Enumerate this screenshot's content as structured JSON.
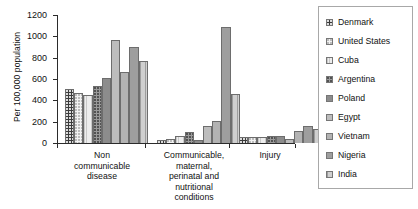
{
  "chart_data": {
    "type": "bar",
    "title": "",
    "subtitle": "",
    "xlabel": "",
    "ylabel": "Per 100,000 population",
    "ylim": [
      0,
      1200
    ],
    "yticks": [
      0,
      200,
      400,
      600,
      800,
      1000,
      1200
    ],
    "grid": false,
    "legend_position": "right",
    "categories": [
      "Non communicable disease",
      "Communicable, maternal, perinatal and nutritional conditions",
      "Injury"
    ],
    "category_labels": [
      [
        "Non",
        "communicable",
        "disease"
      ],
      [
        "Communicable,",
        "maternal,",
        "perinatal and",
        "nutritional",
        "conditions"
      ],
      [
        "Injury"
      ]
    ],
    "series": [
      {
        "name": "Denmark",
        "swatch": "dark-dotted",
        "values": [
          510,
          30,
          55
        ]
      },
      {
        "name": "United States",
        "swatch": "light-dotted",
        "values": [
          465,
          40,
          55
        ]
      },
      {
        "name": "Cuba",
        "swatch": "light-hatch",
        "values": [
          450,
          70,
          55
        ]
      },
      {
        "name": "Argentina",
        "swatch": "gray-dotted",
        "values": [
          530,
          100,
          65
        ]
      },
      {
        "name": "Poland",
        "swatch": "dark-solid",
        "values": [
          605,
          25,
          70
        ]
      },
      {
        "name": "Egypt",
        "swatch": "light-solid",
        "values": [
          970,
          160,
          35
        ]
      },
      {
        "name": "Vietnam",
        "swatch": "pale-solid",
        "values": [
          670,
          210,
          110
        ]
      },
      {
        "name": "Nigeria",
        "swatch": "medium-solid",
        "values": [
          900,
          1090,
          155
        ]
      },
      {
        "name": "India",
        "swatch": "pale-hatch",
        "values": [
          765,
          455,
          135
        ]
      }
    ]
  },
  "legend": {
    "items": [
      {
        "label": "Denmark"
      },
      {
        "label": "United States"
      },
      {
        "label": "Cuba"
      },
      {
        "label": "Argentina"
      },
      {
        "label": "Poland"
      },
      {
        "label": "Egypt"
      },
      {
        "label": "Vietnam"
      },
      {
        "label": "Nigeria"
      },
      {
        "label": "India"
      }
    ]
  },
  "axis": {
    "y_title": "Per 100,000 population",
    "y_ticks": [
      "0",
      "200",
      "400",
      "600",
      "800",
      "1000",
      "1200"
    ]
  },
  "colors": {
    "axis": "#2b2b2b",
    "text": "#111111",
    "legend_border": "#a8a8a8",
    "bar_outline": "#6d6d6d"
  }
}
